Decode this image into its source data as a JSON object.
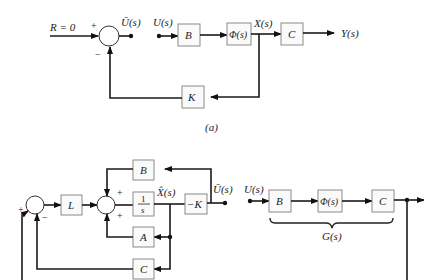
{
  "diagram_a": {
    "caption": "(a)",
    "reference_input": "R = 0",
    "summing_signs": {
      "plus": "+",
      "minus": "−"
    },
    "u_bar": "Ū(s)",
    "u": "U(s)",
    "blocks": {
      "B": "B",
      "Phi": "Φ(s)",
      "C": "C",
      "K": "K"
    },
    "state": "X(s)",
    "output": "Y(s)"
  },
  "diagram_b": {
    "blocks": {
      "L": "L",
      "integrator_num": "1",
      "integrator_den": "s",
      "negK": "−K",
      "B": "B",
      "A": "A",
      "C": "C"
    },
    "signs": {
      "plus": "+",
      "minus": "−"
    },
    "x_hat": "X̂(s)",
    "u_bar": "Ū(s)",
    "u": "U(s)",
    "plant_blocks": {
      "B": "B",
      "Phi": "Φ(s)",
      "C": "C"
    },
    "plant_label": "G(s)"
  }
}
